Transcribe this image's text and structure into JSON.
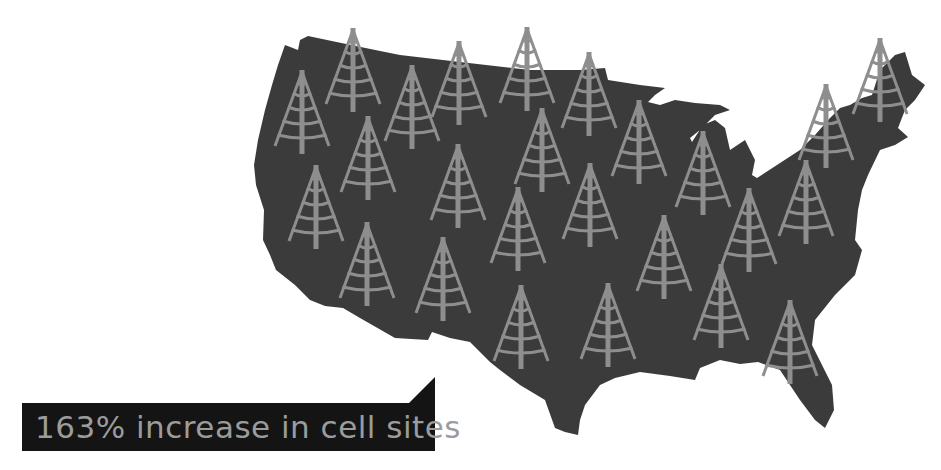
{
  "infographic": {
    "caption": "163% increase in cell sites",
    "subject": "United States map covered with cell tower icons"
  },
  "colors": {
    "background": "#ffffff",
    "map_fill": "#3b3b3b",
    "tower": "#8e8e8e",
    "label_bg": "#141414",
    "label_text": "#9c9c9c"
  },
  "towers": [
    {
      "x": 353,
      "y": 28
    },
    {
      "x": 302,
      "y": 70
    },
    {
      "x": 412,
      "y": 65
    },
    {
      "x": 459,
      "y": 41
    },
    {
      "x": 527,
      "y": 27
    },
    {
      "x": 589,
      "y": 52
    },
    {
      "x": 542,
      "y": 108
    },
    {
      "x": 639,
      "y": 100
    },
    {
      "x": 880,
      "y": 38
    },
    {
      "x": 826,
      "y": 84
    },
    {
      "x": 703,
      "y": 131
    },
    {
      "x": 806,
      "y": 160
    },
    {
      "x": 749,
      "y": 188
    },
    {
      "x": 368,
      "y": 116
    },
    {
      "x": 458,
      "y": 144
    },
    {
      "x": 316,
      "y": 165
    },
    {
      "x": 518,
      "y": 187
    },
    {
      "x": 590,
      "y": 163
    },
    {
      "x": 367,
      "y": 222
    },
    {
      "x": 443,
      "y": 237
    },
    {
      "x": 521,
      "y": 285
    },
    {
      "x": 608,
      "y": 283
    },
    {
      "x": 664,
      "y": 215
    },
    {
      "x": 721,
      "y": 264
    },
    {
      "x": 790,
      "y": 300
    }
  ]
}
